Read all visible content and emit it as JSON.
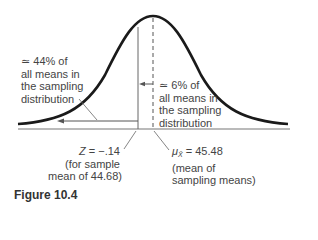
{
  "figure": {
    "caption": "Figure 10.4",
    "type": "normal sampling distribution diagram"
  },
  "annotations": {
    "left_region": {
      "line1": "≃ 44% of",
      "line2": "all means in",
      "line3": "the sampling",
      "line4": "distribution"
    },
    "middle_region": {
      "line1": "≃ 6% of",
      "line2": "all means in",
      "line3": "the sampling",
      "line4": "distribution"
    },
    "z_marker": {
      "symbol": "Z",
      "value_text": " = −.14",
      "line2": "(for sample",
      "line3": "mean of 44.68)"
    },
    "mean_marker": {
      "symbol": "μ",
      "subscript": "X̄",
      "value_text": " = 45.48",
      "line2": "(mean of",
      "line3": "sampling means)"
    }
  },
  "colors": {
    "curve": "#1a1a1a",
    "lines": "#555555",
    "text": "#444444"
  }
}
